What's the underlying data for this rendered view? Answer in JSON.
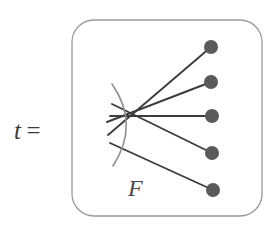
{
  "figure": {
    "type": "math-diagram",
    "equation": {
      "variable": "t",
      "relation": "=",
      "full_text": "t ="
    },
    "box": {
      "shape": "rounded-rectangle",
      "x": 72,
      "y": 20,
      "width": 190,
      "height": 196,
      "corner_radius": 22,
      "stroke_color": "#9a9a9a",
      "stroke_width": 1.3,
      "fill": "#ffffff"
    },
    "arc": {
      "label": "F",
      "stroke_color": "#8e8e8e",
      "stroke_width": 1.6,
      "path_start": {
        "x": 112,
        "y": 84
      },
      "path_control": {
        "x": 140,
        "y": 124
      },
      "path_end": {
        "x": 113,
        "y": 166
      }
    },
    "label_F": {
      "text": "F",
      "x": 128,
      "y": 176,
      "color": "#4a4a4a"
    },
    "strand_color": "#3c3c3c",
    "strand_width": 1.9,
    "dot_color": "#5a5a5a",
    "dot_radius": 7,
    "strands": [
      {
        "name": "strand-1",
        "x1": 108,
        "y1": 135,
        "x2": 211,
        "y2": 47
      },
      {
        "name": "strand-2",
        "x1": 107,
        "y1": 122,
        "x2": 211,
        "y2": 82
      },
      {
        "name": "strand-3",
        "x1": 110,
        "y1": 116,
        "x2": 212,
        "y2": 116
      },
      {
        "name": "strand-4",
        "x1": 112,
        "y1": 104,
        "x2": 212,
        "y2": 153
      },
      {
        "name": "strand-5",
        "x1": 110,
        "y1": 143,
        "x2": 213,
        "y2": 190
      }
    ],
    "dots": [
      {
        "name": "endpoint-dot-1",
        "cx": 211,
        "cy": 47
      },
      {
        "name": "endpoint-dot-2",
        "cx": 211,
        "cy": 82
      },
      {
        "name": "endpoint-dot-3",
        "cx": 212,
        "cy": 116
      },
      {
        "name": "endpoint-dot-4",
        "cx": 212,
        "cy": 153
      },
      {
        "name": "endpoint-dot-5",
        "cx": 213,
        "cy": 190
      }
    ]
  }
}
